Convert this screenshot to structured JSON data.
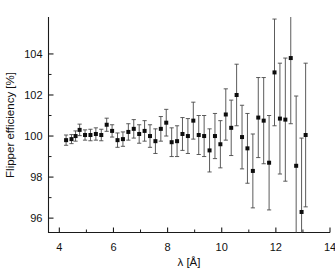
{
  "chart_data": {
    "type": "scatter",
    "title": "",
    "subtitle": "",
    "xlabel": "λ [Å]",
    "ylabel": "Flipper efficiency [%]",
    "xlim": [
      3.6,
      14.0
    ],
    "ylim": [
      95.3,
      105.8
    ],
    "xticks": [
      4,
      6,
      8,
      10,
      12,
      14
    ],
    "xticklabels": [
      "4",
      "6",
      "8",
      "10",
      "12",
      "14"
    ],
    "yticks": [
      96,
      98,
      100,
      102,
      104
    ],
    "yticklabels": [
      "96",
      "98",
      "100",
      "102",
      "104"
    ],
    "grid": false,
    "legend": null,
    "marker": "filled-square",
    "errorbars": "symmetric-y",
    "series": [
      {
        "name": "Flipper efficiency vs wavelength",
        "x": [
          4.25,
          4.45,
          4.6,
          4.75,
          4.95,
          5.15,
          5.35,
          5.55,
          5.75,
          5.95,
          6.15,
          6.35,
          6.55,
          6.75,
          6.95,
          7.15,
          7.35,
          7.55,
          7.75,
          7.95,
          8.15,
          8.35,
          8.55,
          8.75,
          8.95,
          9.15,
          9.35,
          9.55,
          9.75,
          9.95,
          10.15,
          10.35,
          10.55,
          10.75,
          10.95,
          11.15,
          11.35,
          11.55,
          11.75,
          11.95,
          12.15,
          12.35,
          12.55,
          12.75,
          12.95,
          13.1
        ],
        "y": [
          99.8,
          99.85,
          100.0,
          100.3,
          100.05,
          100.05,
          100.1,
          100.05,
          100.55,
          100.25,
          99.8,
          99.85,
          100.2,
          100.35,
          100.1,
          100.25,
          100.0,
          99.75,
          100.35,
          100.65,
          99.7,
          99.75,
          100.1,
          100.0,
          100.75,
          100.05,
          100.0,
          99.3,
          100.0,
          99.6,
          101.05,
          100.4,
          102.0,
          99.95,
          99.4,
          98.3,
          100.9,
          100.75,
          98.7,
          103.1,
          100.85,
          100.8,
          103.8,
          98.55,
          96.3,
          100.05
        ],
        "yerr": [
          0.25,
          0.22,
          0.25,
          0.28,
          0.25,
          0.28,
          0.3,
          0.28,
          0.32,
          0.3,
          0.35,
          0.35,
          0.4,
          0.45,
          0.45,
          0.5,
          0.55,
          0.6,
          0.6,
          0.65,
          0.7,
          0.75,
          0.8,
          0.85,
          0.9,
          0.95,
          1.0,
          1.05,
          1.1,
          1.15,
          1.25,
          1.35,
          1.5,
          1.55,
          1.7,
          1.8,
          1.95,
          2.1,
          2.3,
          2.6,
          2.7,
          3.0,
          3.2,
          3.4,
          3.6,
          3.5
        ]
      }
    ]
  }
}
